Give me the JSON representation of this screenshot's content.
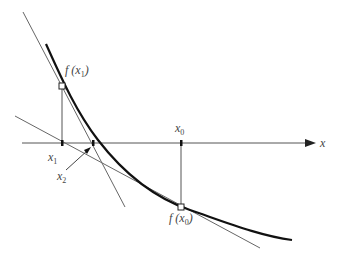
{
  "diagram": {
    "axis": {
      "label": "x"
    },
    "points": {
      "x0": {
        "label_var": "x",
        "label_sub": "0"
      },
      "x1": {
        "label_var": "x",
        "label_sub": "1"
      },
      "x2": {
        "label_var": "x",
        "label_sub": "2"
      },
      "fx0": {
        "label_pre": "f (x",
        "label_sub": "0",
        "label_post": ")"
      },
      "fx1": {
        "label_pre": "f (x",
        "label_sub": "1",
        "label_post": ")"
      }
    },
    "colors": {
      "curve": "#111111",
      "lines": "#666666",
      "axis": "#555555"
    }
  }
}
